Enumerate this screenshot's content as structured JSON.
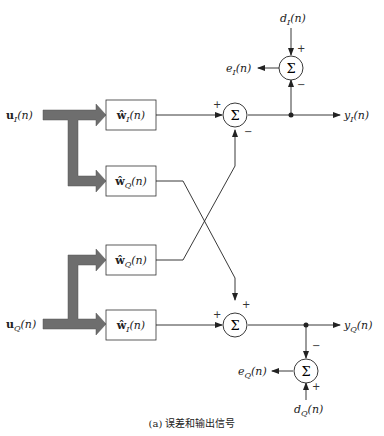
{
  "caption": "(a)  误差和输出信号",
  "inputs": {
    "u_I": {
      "base": "u",
      "sub": "I",
      "arg": "(n)"
    },
    "u_Q": {
      "base": "u",
      "sub": "Q",
      "arg": "(n)"
    }
  },
  "filters": [
    {
      "base": "ŵ",
      "sub": "I",
      "arg": "(n)"
    },
    {
      "base": "ŵ",
      "sub": "Q",
      "arg": "(n)"
    },
    {
      "base": "ŵ",
      "sub": "Q",
      "arg": "(n)"
    },
    {
      "base": "ŵ",
      "sub": "I",
      "arg": "(n)"
    }
  ],
  "summers": {
    "symbol": "Σ",
    "top_output": {
      "plus": "+",
      "minus": "−"
    },
    "top_error": {
      "plus": "+",
      "minus": "−"
    },
    "bottom_output": {
      "plus_left": "+",
      "plus_top": "+"
    },
    "bottom_error": {
      "minus": "−",
      "plus": "+"
    }
  },
  "signals": {
    "d_I": {
      "base": "d",
      "sub": "I",
      "arg": "(n)"
    },
    "e_I": {
      "base": "e",
      "sub": "I",
      "arg": "(n)"
    },
    "y_I": {
      "base": "y",
      "sub": "I",
      "arg": "(n)"
    },
    "y_Q": {
      "base": "y",
      "sub": "Q",
      "arg": "(n)"
    },
    "e_Q": {
      "base": "e",
      "sub": "Q",
      "arg": "(n)"
    },
    "d_Q": {
      "base": "d",
      "sub": "Q",
      "arg": "(n)"
    }
  },
  "colors": {
    "line": "#222222",
    "bus_arrow": "#6e6e6e",
    "background": "#ffffff"
  }
}
